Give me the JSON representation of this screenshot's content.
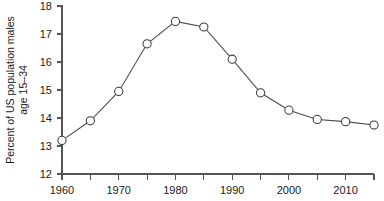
{
  "chart_data": {
    "type": "line",
    "title": "",
    "subtitle": "",
    "xlabel": "",
    "ylabel": "Percent of US population males age 15–34",
    "ylabel_line1": "Percent of US population males",
    "ylabel_line2": "age 15–34",
    "x": [
      1960,
      1965,
      1970,
      1975,
      1980,
      1985,
      1990,
      1995,
      2000,
      2005,
      2010,
      2015
    ],
    "values": [
      13.2,
      13.9,
      14.95,
      16.65,
      17.45,
      17.25,
      16.1,
      14.9,
      14.28,
      13.95,
      13.87,
      13.75
    ],
    "xlim": [
      1960,
      2015
    ],
    "ylim": [
      12,
      18
    ],
    "xticks": [
      1960,
      1965,
      1970,
      1975,
      1980,
      1985,
      1990,
      1995,
      2000,
      2005,
      2010,
      2015
    ],
    "xtick_labels": [
      "1960",
      "",
      "1970",
      "",
      "1980",
      "",
      "1990",
      "",
      "2000",
      "",
      "2010",
      ""
    ],
    "yticks": [
      12,
      13,
      14,
      15,
      16,
      17,
      18
    ],
    "ytick_labels": [
      "12",
      "13",
      "14",
      "15",
      "16",
      "17",
      "18"
    ],
    "grid": false,
    "legend": false,
    "legend_position": "none",
    "marker": "open-circle",
    "line_color": "#4a4a4a",
    "marker_face_color": "#ffffff",
    "marker_edge_color": "#3d3d3d",
    "background_color": "#ffffff",
    "axis_color": "#555555"
  }
}
